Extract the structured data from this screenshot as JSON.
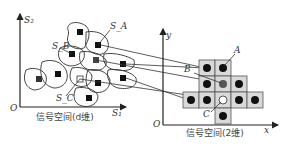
{
  "left_panel": {
    "axis_y_label": "S₂",
    "axis_x_label": "S₁",
    "origin_label": "O",
    "caption": "信号空间(d维)",
    "region_labels": {
      "a": "S_A",
      "b": "S_B",
      "c": "S_C"
    }
  },
  "right_panel": {
    "axis_y_label": "y",
    "axis_x_label": "x",
    "origin_label": "O",
    "caption": "信号空间(2维)",
    "point_labels": {
      "a": "A",
      "b": "B",
      "c": "C"
    },
    "grid_rows": [
      {
        "cells": 2
      },
      {
        "cells": 3
      },
      {
        "cells": 5
      },
      {
        "cells": 1
      }
    ]
  },
  "colors": {
    "ink": "#222222",
    "cell_fill": "#d9d9d9",
    "cell_stroke": "#555555",
    "line": "#333333"
  }
}
